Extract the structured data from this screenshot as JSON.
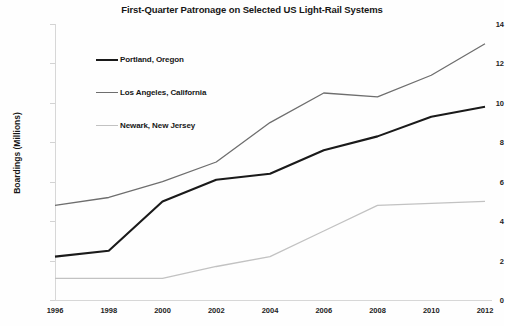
{
  "chart_data": {
    "type": "line",
    "title": "First-Quarter Patronage on Selected US Light-Rail Systems",
    "xlabel": "",
    "ylabel": "Boardings (Millions)",
    "categories": [
      "1996",
      "1998",
      "2000",
      "2002",
      "2004",
      "2006",
      "2008",
      "2010",
      "2012"
    ],
    "x_tick_labels": [
      "1996",
      "1998",
      "2000",
      "2002",
      "2004",
      "2006",
      "2008",
      "2010",
      "2012"
    ],
    "y_tick_labels": [
      "0",
      "2",
      "4",
      "6",
      "8",
      "10",
      "12",
      "14"
    ],
    "y_ticks": [
      0,
      2,
      4,
      6,
      8,
      10,
      12,
      14
    ],
    "ylim": [
      0,
      14
    ],
    "grid": false,
    "legend_position": "upper-left-inside",
    "series": [
      {
        "name": "Portland, Oregon",
        "color": "#1a1a1a",
        "width": 2.1,
        "values": [
          2.2,
          2.5,
          5.0,
          6.1,
          6.4,
          7.6,
          8.3,
          9.3,
          9.8
        ]
      },
      {
        "name": "Los Angeles, California",
        "color": "#6e6e6e",
        "width": 1.3,
        "values": [
          4.8,
          5.2,
          6.0,
          7.0,
          9.0,
          10.5,
          10.3,
          11.4,
          13.0
        ]
      },
      {
        "name": "Newark, New Jersey",
        "color": "#c2c2c2",
        "width": 1.3,
        "values": [
          1.1,
          1.1,
          1.1,
          1.7,
          2.2,
          3.5,
          4.8,
          4.9,
          5.0
        ]
      }
    ]
  },
  "legend": {
    "items": [
      {
        "label": "Portland, Oregon"
      },
      {
        "label": "Los Angeles, California"
      },
      {
        "label": "Newark, New Jersey"
      }
    ]
  }
}
